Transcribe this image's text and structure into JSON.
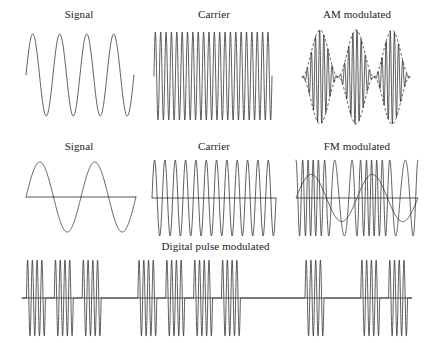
{
  "figure": {
    "title_visible": false,
    "width": 431,
    "height": 343,
    "background": "#ffffff",
    "stroke_color": "#2b2b2b",
    "axis_color": "#2b2b2b"
  },
  "chart_data": {
    "type": "line",
    "title": "",
    "xlabel": "",
    "ylabel": "",
    "grid": false,
    "legend": "none",
    "panels": [
      {
        "id": "am-signal",
        "label": "Signal",
        "row": 1,
        "column": 1,
        "waveform": "sine",
        "cycles": 4,
        "amplitude": 1.0,
        "phase_deg": 0,
        "axis_line": false,
        "x_px": 14,
        "y_px": 8,
        "w_px": 130,
        "h_px": 112,
        "plot_x": 12,
        "plot_y": 26,
        "plot_w": 108,
        "plot_h": 82
      },
      {
        "id": "am-carrier",
        "label": "Carrier",
        "row": 1,
        "column": 2,
        "waveform": "sine",
        "cycles": 22,
        "amplitude": 1.0,
        "phase_deg": 0,
        "axis_line": false,
        "x_px": 144,
        "y_px": 8,
        "w_px": 140,
        "h_px": 112,
        "plot_x": 10,
        "plot_y": 24,
        "plot_w": 118,
        "plot_h": 88
      },
      {
        "id": "am-modulated",
        "label": "AM modulated",
        "row": 1,
        "column": 3,
        "waveform": "am",
        "carrier_cycles": 26,
        "modulation_cycles": 3,
        "modulation_index": 1.0,
        "amplitude": 1.0,
        "envelope_dashed": true,
        "axis_line": false,
        "x_px": 288,
        "y_px": 8,
        "w_px": 138,
        "h_px": 112,
        "plot_x": 14,
        "plot_y": 22,
        "plot_w": 108,
        "plot_h": 94
      },
      {
        "id": "fm-signal",
        "label": "Signal",
        "row": 2,
        "column": 1,
        "waveform": "sine",
        "cycles": 2,
        "amplitude": 1.0,
        "phase_deg": 0,
        "axis_line": true,
        "x_px": 14,
        "y_px": 140,
        "w_px": 130,
        "h_px": 96,
        "plot_x": 12,
        "plot_y": 22,
        "plot_w": 110,
        "plot_h": 70
      },
      {
        "id": "fm-carrier",
        "label": "Carrier",
        "row": 2,
        "column": 2,
        "waveform": "sine",
        "cycles": 12,
        "amplitude": 1.0,
        "phase_deg": 0,
        "axis_line": true,
        "x_px": 144,
        "y_px": 140,
        "w_px": 140,
        "h_px": 96,
        "plot_x": 8,
        "plot_y": 20,
        "plot_w": 124,
        "plot_h": 76
      },
      {
        "id": "fm-modulated",
        "label": "FM modulated",
        "row": 2,
        "column": 3,
        "waveform": "fm",
        "carrier_cycles": 15,
        "modulation_cycles": 2,
        "frequency_deviation": 0.62,
        "amplitude": 1.0,
        "overlay_modulator": true,
        "overlay_amplitude": 0.62,
        "axis_line": true,
        "x_px": 288,
        "y_px": 140,
        "w_px": 138,
        "h_px": 96,
        "plot_x": 8,
        "plot_y": 20,
        "plot_w": 122,
        "plot_h": 76
      },
      {
        "id": "digital-pulse-modulated",
        "label": "Digital pulse modulated",
        "row": 3,
        "column": 1,
        "waveform": "pulse-bursts",
        "carrier_cycles_per_burst": 4,
        "burst_count": 9,
        "amplitude": 1.0,
        "axis_line": true,
        "burst_slots": [
          1,
          1,
          1,
          0,
          1,
          1,
          1,
          1,
          0,
          0,
          1,
          0,
          1,
          1
        ],
        "x_px": 8,
        "y_px": 240,
        "w_px": 415,
        "h_px": 100,
        "plot_x": 14,
        "plot_y": 20,
        "plot_w": 390,
        "plot_h": 76
      }
    ]
  }
}
